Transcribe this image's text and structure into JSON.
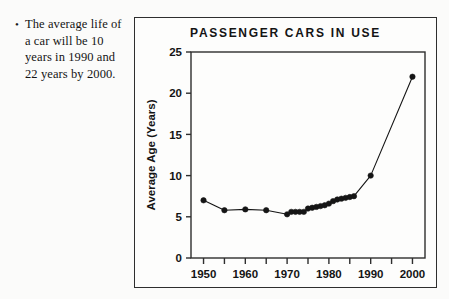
{
  "bullet": {
    "marker": "•",
    "text": "The average life of a car will be 10 years in 1990 and 22 years by 2000."
  },
  "figure": {
    "title": "PASSENGER CARS IN USE"
  },
  "chart_data": {
    "type": "line",
    "title": "PASSENGER CARS IN USE",
    "xlabel": "",
    "ylabel": "Average Age (Years)",
    "xlim": [
      1947,
      2003
    ],
    "ylim": [
      0,
      25
    ],
    "grid": false,
    "legend": null,
    "x_ticks": [
      1950,
      1960,
      1970,
      1980,
      1990,
      2000
    ],
    "x_tick_labels": [
      "1950",
      "1960",
      "1970",
      "1980",
      "1990",
      "2000"
    ],
    "x_minor_ticks": [
      1955,
      1965,
      1975,
      1985,
      1995
    ],
    "y_ticks": [
      0,
      5,
      10,
      15,
      20,
      25
    ],
    "y_tick_labels": [
      "0",
      "5",
      "10",
      "15",
      "20",
      "25"
    ],
    "marker": "filled-circle",
    "series": [
      {
        "name": "Average age of passenger cars in use",
        "x": [
          1950,
          1955,
          1960,
          1965,
          1970,
          1971,
          1972,
          1973,
          1974,
          1975,
          1976,
          1977,
          1978,
          1979,
          1980,
          1981,
          1982,
          1983,
          1984,
          1985,
          1986,
          1990,
          2000
        ],
        "values": [
          7.0,
          5.8,
          5.9,
          5.8,
          5.3,
          5.6,
          5.6,
          5.6,
          5.6,
          6.0,
          6.1,
          6.2,
          6.3,
          6.4,
          6.6,
          6.9,
          7.1,
          7.2,
          7.3,
          7.4,
          7.5,
          10.0,
          22.0
        ]
      }
    ]
  }
}
